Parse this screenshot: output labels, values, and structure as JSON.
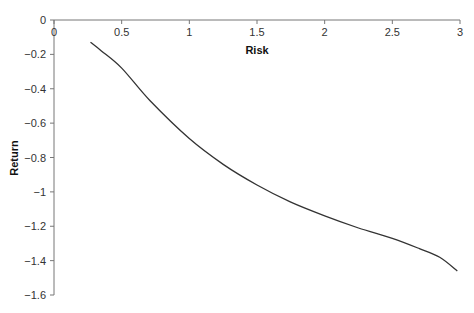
{
  "chart_data": {
    "type": "line",
    "title": "",
    "xlabel": "Risk",
    "ylabel": "Return",
    "xlim": [
      0,
      3
    ],
    "ylim": [
      -1.6,
      0
    ],
    "x_ticks": [
      "0",
      "0.5",
      "1",
      "1.5",
      "2",
      "2.5",
      "3"
    ],
    "y_ticks": [
      "0",
      "-0.2",
      "-0.4",
      "-0.6",
      "-0.8",
      "-1",
      "-1.2",
      "-1.4",
      "-1.6"
    ],
    "x_axis_position": "top (at y=0)",
    "grid": false,
    "legend": null,
    "series": [
      {
        "name": "Return vs Risk",
        "color": "#333333",
        "x": [
          0.27,
          0.35,
          0.5,
          0.71,
          1.0,
          1.25,
          1.5,
          1.75,
          2.0,
          2.25,
          2.5,
          2.7,
          2.85,
          2.98
        ],
        "y": [
          -0.13,
          -0.18,
          -0.28,
          -0.47,
          -0.69,
          -0.84,
          -0.96,
          -1.06,
          -1.14,
          -1.21,
          -1.27,
          -1.33,
          -1.38,
          -1.46
        ]
      }
    ]
  }
}
